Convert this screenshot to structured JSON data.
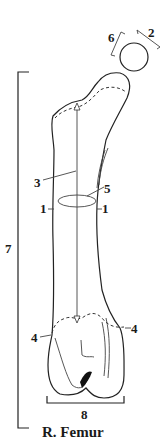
{
  "diagram": {
    "title": "R. Femur",
    "labels": {
      "l1_left": "1",
      "l1_right": "1",
      "l2": "2",
      "l3": "3",
      "l4_left": "4",
      "l4_right": "4",
      "l5": "5",
      "l6": "6",
      "l7": "7",
      "l8": "8"
    },
    "colors": {
      "stroke": "#222222",
      "background": "#ffffff"
    }
  }
}
